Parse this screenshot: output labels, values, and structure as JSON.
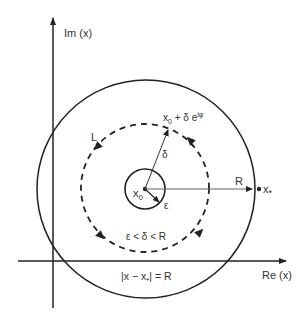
{
  "diagram": {
    "axes": {
      "x_label": "Re (x)",
      "y_label": "Im (x)"
    },
    "labels": {
      "contour": "L",
      "delta": "δ",
      "center": "x",
      "center_sub": "0",
      "epsilon": "ε",
      "inequality": "ε < δ < R",
      "point_base": "x",
      "point_sub": "0",
      "point_rest": " + δ e",
      "point_sup": "iφ",
      "radius": "R",
      "singular": "x",
      "singular_sub": "*",
      "circle_eq_left": "|x − x",
      "circle_eq_sub": "*",
      "circle_eq_right": "| = R"
    },
    "colors": {
      "stroke": "#222222",
      "text": "#333333",
      "radius_line": "#666666"
    }
  }
}
